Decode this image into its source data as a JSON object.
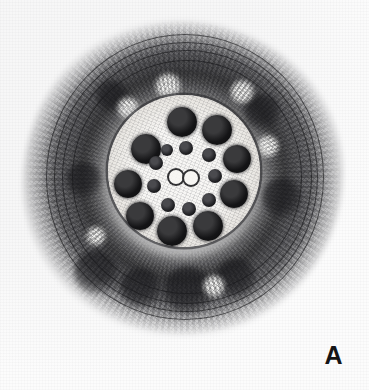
{
  "figure": {
    "panel_label": "A",
    "alt_text": "Transmission electron micrograph of a cilium axoneme in cross section showing the 9+2 microtubule arrangement surrounded by a granular sheath with concentric membrane lamellae.",
    "background_color": "#fdfdfd",
    "ink_color": "#141416"
  },
  "micrograph": {
    "specimen_name": "axoneme-cross-section",
    "structures": {
      "outer_sheath": {
        "name": "granular-sheath",
        "color": "#28282c"
      },
      "membrane_lamellae": {
        "name": "concentric-membrane-lamellae",
        "count": 4,
        "color": "#121214"
      },
      "axoneme_matrix": {
        "name": "axonemal-matrix",
        "color": "#f7f6f4"
      },
      "outer_doublets": {
        "name": "outer-doublet-microtubules",
        "count": 9,
        "color": "#141416"
      },
      "central_pair": {
        "name": "central-pair-microtubules",
        "count": 2,
        "color": "#f6f5f2"
      },
      "radial_spokes": {
        "name": "radial-spoke-heads",
        "count": 9,
        "color": "#1a1a1d"
      }
    },
    "doublets": [
      {
        "id": "doublet-1",
        "cx": 182,
        "cy": 122,
        "r": 15
      },
      {
        "id": "doublet-2",
        "cx": 217,
        "cy": 130,
        "r": 15
      },
      {
        "id": "doublet-3",
        "cx": 237,
        "cy": 159,
        "r": 14
      },
      {
        "id": "doublet-4",
        "cx": 234,
        "cy": 194,
        "r": 14
      },
      {
        "id": "doublet-5",
        "cx": 208,
        "cy": 226,
        "r": 15
      },
      {
        "id": "doublet-6",
        "cx": 172,
        "cy": 231,
        "r": 15
      },
      {
        "id": "doublet-7",
        "cx": 140,
        "cy": 216,
        "r": 14
      },
      {
        "id": "doublet-8",
        "cx": 128,
        "cy": 184,
        "r": 14
      },
      {
        "id": "doublet-9",
        "cx": 146,
        "cy": 149,
        "r": 15
      }
    ],
    "spokes": [
      {
        "id": "spoke-1",
        "cx": 186,
        "cy": 148,
        "r": 7
      },
      {
        "id": "spoke-2",
        "cx": 209,
        "cy": 155,
        "r": 7
      },
      {
        "id": "spoke-3",
        "cx": 215,
        "cy": 176,
        "r": 7
      },
      {
        "id": "spoke-4",
        "cx": 209,
        "cy": 200,
        "r": 7
      },
      {
        "id": "spoke-5",
        "cx": 189,
        "cy": 209,
        "r": 7
      },
      {
        "id": "spoke-6",
        "cx": 168,
        "cy": 205,
        "r": 7
      },
      {
        "id": "spoke-7",
        "cx": 154,
        "cy": 186,
        "r": 7
      },
      {
        "id": "spoke-8",
        "cx": 156,
        "cy": 163,
        "r": 7
      },
      {
        "id": "spoke-9",
        "cx": 167,
        "cy": 150,
        "r": 6
      }
    ],
    "central_pair": [
      {
        "id": "central-tubule-1",
        "cx": 174,
        "cy": 175,
        "r": 7
      },
      {
        "id": "central-tubule-2",
        "cx": 189,
        "cy": 176,
        "r": 7
      }
    ],
    "lamellae": [
      {
        "id": "lamella-1",
        "left": 46,
        "top": 34,
        "w": 276,
        "h": 284,
        "thickness": 1.6
      },
      {
        "id": "lamella-2",
        "left": 54,
        "top": 42,
        "w": 262,
        "h": 268,
        "thickness": 1.4
      },
      {
        "id": "lamella-3",
        "left": 62,
        "top": 50,
        "w": 248,
        "h": 252,
        "thickness": 1.3
      },
      {
        "id": "lamella-4",
        "left": 72,
        "top": 60,
        "w": 228,
        "h": 232,
        "thickness": 1.2
      }
    ],
    "blotches": [
      {
        "id": "blotch-1",
        "cx": 96,
        "cy": 272,
        "r": 22
      },
      {
        "id": "blotch-2",
        "cx": 140,
        "cy": 288,
        "r": 20
      },
      {
        "id": "blotch-3",
        "cx": 188,
        "cy": 290,
        "r": 24
      },
      {
        "id": "blotch-4",
        "cx": 236,
        "cy": 278,
        "r": 20
      },
      {
        "id": "blotch-5",
        "cx": 262,
        "cy": 112,
        "r": 18
      },
      {
        "id": "blotch-6",
        "cx": 112,
        "cy": 96,
        "r": 16
      },
      {
        "id": "blotch-7",
        "cx": 282,
        "cy": 198,
        "r": 20
      },
      {
        "id": "blotch-8",
        "cx": 84,
        "cy": 180,
        "r": 18
      }
    ],
    "lucencies": [
      {
        "id": "lucency-1",
        "cx": 168,
        "cy": 86,
        "r": 13
      },
      {
        "id": "lucency-2",
        "cx": 242,
        "cy": 92,
        "r": 12
      },
      {
        "id": "lucency-3",
        "cx": 128,
        "cy": 108,
        "r": 11
      },
      {
        "id": "lucency-4",
        "cx": 268,
        "cy": 146,
        "r": 11
      },
      {
        "id": "lucency-5",
        "cx": 214,
        "cy": 286,
        "r": 11
      },
      {
        "id": "lucency-6",
        "cx": 96,
        "cy": 236,
        "r": 10
      }
    ]
  }
}
